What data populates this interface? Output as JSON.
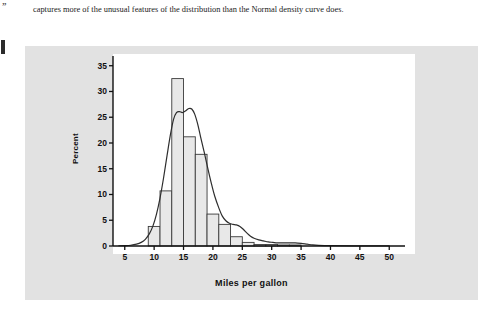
{
  "margin": {
    "glyph": "”",
    "rule_mark": "black-vertical-rule"
  },
  "paragraph": {
    "text": "captures more of the unusual features of the distribution than the Normal density curve does."
  },
  "chart_data": {
    "type": "bar",
    "title": "",
    "xlabel": "Miles per gallon",
    "ylabel": "Percent",
    "xlim": [
      3,
      52
    ],
    "ylim": [
      0,
      36.5
    ],
    "grid": false,
    "legend": null,
    "xticks": [
      5,
      10,
      15,
      20,
      25,
      30,
      35,
      40,
      45,
      50
    ],
    "xtick_labels": [
      "5",
      "10",
      "15",
      "20",
      "25",
      "30",
      "35",
      "40",
      "45",
      "50"
    ],
    "yticks": [
      0,
      5,
      10,
      15,
      20,
      25,
      30,
      35
    ],
    "ytick_labels": [
      "0",
      "5",
      "10",
      "15",
      "20",
      "25",
      "30",
      "35"
    ],
    "bar_edges": [
      9,
      11,
      13,
      15,
      17,
      19,
      21,
      23,
      25,
      27,
      29,
      31,
      33,
      35
    ],
    "values": [
      3.8,
      10.7,
      32.5,
      21.2,
      17.8,
      6.2,
      4.2,
      1.8,
      0.7,
      0.3,
      0.3,
      0.2,
      0.2
    ],
    "bar_fill": "#e8e8e8",
    "bar_stroke": "#3a3a3a",
    "density_curve": {
      "name": "density curve",
      "stroke": "#2e2e2e",
      "points": [
        [
          4.0,
          0.05
        ],
        [
          5.0,
          0.08
        ],
        [
          6.0,
          0.15
        ],
        [
          7.0,
          0.35
        ],
        [
          7.8,
          0.7
        ],
        [
          8.5,
          1.3
        ],
        [
          9.2,
          2.4
        ],
        [
          9.8,
          3.9
        ],
        [
          10.4,
          6.2
        ],
        [
          11.0,
          9.3
        ],
        [
          11.6,
          13.2
        ],
        [
          12.2,
          17.6
        ],
        [
          12.8,
          21.8
        ],
        [
          13.3,
          24.6
        ],
        [
          13.8,
          25.9
        ],
        [
          14.3,
          26.1
        ],
        [
          14.8,
          25.9
        ],
        [
          15.3,
          26.2
        ],
        [
          15.9,
          26.7
        ],
        [
          16.4,
          26.6
        ],
        [
          16.9,
          25.6
        ],
        [
          17.4,
          23.7
        ],
        [
          17.9,
          21.2
        ],
        [
          18.5,
          18.3
        ],
        [
          19.1,
          15.2
        ],
        [
          19.7,
          12.3
        ],
        [
          20.3,
          9.7
        ],
        [
          21.0,
          7.4
        ],
        [
          21.6,
          5.8
        ],
        [
          22.2,
          4.9
        ],
        [
          22.8,
          4.4
        ],
        [
          23.4,
          4.2
        ],
        [
          24.0,
          4.1
        ],
        [
          24.6,
          3.8
        ],
        [
          25.2,
          3.2
        ],
        [
          25.8,
          2.5
        ],
        [
          26.4,
          1.9
        ],
        [
          27.0,
          1.5
        ],
        [
          27.8,
          1.2
        ],
        [
          28.6,
          1.0
        ],
        [
          29.4,
          0.8
        ],
        [
          30.2,
          0.7
        ],
        [
          31.0,
          0.6
        ],
        [
          32.0,
          0.6
        ],
        [
          33.0,
          0.6
        ],
        [
          34.0,
          0.6
        ],
        [
          35.0,
          0.5
        ],
        [
          36.0,
          0.35
        ],
        [
          37.0,
          0.2
        ],
        [
          38.0,
          0.12
        ],
        [
          40.0,
          0.06
        ],
        [
          44.0,
          0.03
        ],
        [
          50.0,
          0.02
        ]
      ]
    },
    "axis_color": "#111111",
    "panel_background": "#ffffff",
    "figure_background": "#e2e2e2"
  }
}
